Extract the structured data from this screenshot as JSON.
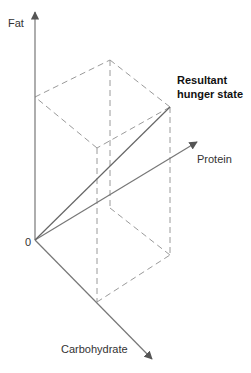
{
  "diagram": {
    "axes": {
      "fat": {
        "label": "Fat"
      },
      "protein": {
        "label": "Protein"
      },
      "carbohydrate": {
        "label": "Carbohydrate"
      },
      "origin": {
        "label": "0"
      }
    },
    "resultant": {
      "label_line1": "Resultant",
      "label_line2": "hunger state"
    },
    "colors": {
      "axis": "#777777",
      "dashed": "#9a9a9a",
      "vector": "#666666",
      "text": "#333333"
    }
  }
}
